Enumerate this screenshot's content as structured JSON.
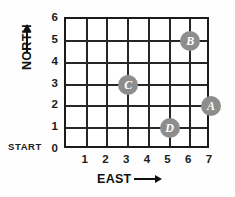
{
  "chart_data": {
    "type": "scatter",
    "title": "",
    "xlabel": "EAST",
    "ylabel": "NORTH",
    "xlim": [
      0,
      7
    ],
    "ylim": [
      0,
      6
    ],
    "grid": true,
    "legend": "none",
    "x_ticks": [
      "1",
      "2",
      "3",
      "4",
      "5",
      "6",
      "7"
    ],
    "y_ticks": [
      "6",
      "5",
      "4",
      "3",
      "2",
      "1",
      "0"
    ],
    "origin_annotation": "START",
    "points": [
      {
        "label": "A",
        "x": 7,
        "y": 2
      },
      {
        "label": "B",
        "x": 6,
        "y": 5
      },
      {
        "label": "C",
        "x": 3,
        "y": 3
      },
      {
        "label": "D",
        "x": 5,
        "y": 1
      }
    ],
    "marker_color": "#8d8d8d",
    "marker_text_color": "#ffffff",
    "grid_color": "#262626",
    "axis_color": "#1b1b1b",
    "background": "#fefefe"
  },
  "axes": {
    "north_label": "NORTH",
    "east_label": "EAST",
    "start_label": "START"
  }
}
